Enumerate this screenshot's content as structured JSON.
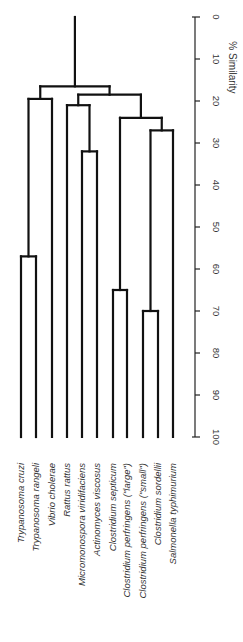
{
  "chart_data": {
    "type": "dendrogram",
    "orientation": "rotated-90 (root at top, leaves at bottom, labels rotated)",
    "title": "",
    "axis": {
      "label": "% Similarity",
      "range": [
        0,
        100
      ],
      "ticks": [
        0,
        10,
        20,
        30,
        40,
        50,
        60,
        70,
        80,
        90,
        100
      ]
    },
    "leaves": [
      "Trypanosoma cruzi",
      "Trypanosoma rangeli",
      "Vibrio cholerae",
      "Rattus rattus",
      "Micromonospora viridifaciens",
      "Actinomyces viscosus",
      "Clostridium septicum",
      "Clostridium perfringens (\"large\")",
      "Clostridium perfringens (\"small\")",
      "Clostridium sordellii",
      "Salmonella typhimurium"
    ],
    "merges": [
      {
        "id": "n1",
        "children": [
          "L0",
          "L1"
        ],
        "similarity": 57
      },
      {
        "id": "n2",
        "children": [
          "n1",
          "L2"
        ],
        "similarity": 19.5
      },
      {
        "id": "n3",
        "children": [
          "L4",
          "L5"
        ],
        "similarity": 32
      },
      {
        "id": "n4",
        "children": [
          "L3",
          "n3"
        ],
        "similarity": 21
      },
      {
        "id": "n5",
        "children": [
          "L6",
          "L7"
        ],
        "similarity": 65
      },
      {
        "id": "n6",
        "children": [
          "L8",
          "L9"
        ],
        "similarity": 70
      },
      {
        "id": "n7",
        "children": [
          "n6",
          "L10"
        ],
        "similarity": 27
      },
      {
        "id": "n8",
        "children": [
          "n5",
          "n7"
        ],
        "similarity": 24
      },
      {
        "id": "n9",
        "children": [
          "n4",
          "n8"
        ],
        "similarity": 18.5
      },
      {
        "id": "n10",
        "children": [
          "n2",
          "n9"
        ],
        "similarity": 16.5
      }
    ],
    "root_similarity": 0,
    "grid": false,
    "legend": null
  },
  "layout": {
    "leaf_x": [
      21,
      36,
      52,
      67,
      82,
      97,
      113,
      127,
      143,
      158,
      173
    ],
    "y_at_0": 17,
    "y_at_100": 437,
    "axis_x": 195,
    "label_anchor_y": 463
  }
}
